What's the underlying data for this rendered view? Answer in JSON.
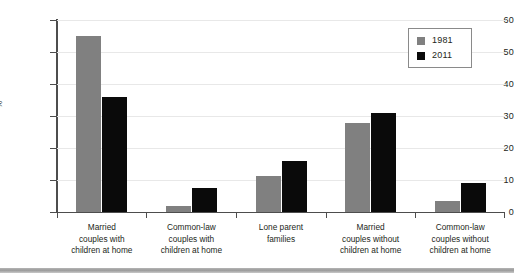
{
  "chart_data": {
    "type": "bar",
    "title": "",
    "xlabel": "",
    "ylabel": "%",
    "ylim": [
      0,
      60
    ],
    "yticks": [
      0,
      10,
      20,
      30,
      40,
      50,
      60
    ],
    "ytick_labels": [
      "0",
      "10",
      "20",
      "30",
      "40",
      "50",
      "60"
    ],
    "grid": true,
    "legend_position": "top-right",
    "categories": [
      "Married couples with children at home",
      "Common-law couples with children at home",
      "Lone parent families",
      "Married couples without children at home",
      "Common-law couples without children at home"
    ],
    "category_lines": [
      [
        "Married",
        "couples with",
        "children at home"
      ],
      [
        "Common-law",
        "couples with",
        "children at home"
      ],
      [
        "Lone parent",
        "families"
      ],
      [
        "Married",
        "couples without",
        "children at home"
      ],
      [
        "Common-law",
        "couples without",
        "children at home"
      ]
    ],
    "series": [
      {
        "name": "1981",
        "color": "#808080",
        "values": [
          55.0,
          2.0,
          11.3,
          27.8,
          3.5
        ]
      },
      {
        "name": "2011",
        "color": "#0a0a0a",
        "values": [
          36.0,
          7.5,
          16.0,
          30.8,
          9.2
        ]
      }
    ]
  },
  "legend": {
    "items": [
      {
        "label": "1981",
        "color": "#808080"
      },
      {
        "label": "2011",
        "color": "#0a0a0a"
      }
    ]
  },
  "axes": {
    "y_label": "%",
    "y_tick_labels": [
      "60",
      "50",
      "40",
      "30",
      "20",
      "10",
      "0"
    ]
  }
}
